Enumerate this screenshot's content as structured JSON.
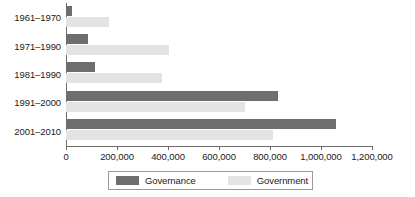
{
  "chart_data": {
    "type": "bar",
    "orientation": "horizontal",
    "title": "",
    "xlabel": "",
    "ylabel": "",
    "xlim": [
      0,
      1200000
    ],
    "grid": false,
    "legend_position": "bottom",
    "categories": [
      "1961–1970",
      "1971–1990",
      "1981–1990",
      "1991–2000",
      "2001–2010"
    ],
    "xticks": [
      0,
      200000,
      400000,
      600000,
      800000,
      1000000,
      1200000
    ],
    "xtick_labels": [
      "0",
      "200,000",
      "400,000",
      "600,000",
      "800,000",
      "1,000,000",
      "1,200,000"
    ],
    "series": [
      {
        "name": "Governance",
        "color": "#6e6e6e",
        "values": [
          25000,
          88000,
          115000,
          830000,
          1060000
        ]
      },
      {
        "name": "Government",
        "color": "#e3e3e3",
        "values": [
          170000,
          405000,
          375000,
          700000,
          810000
        ]
      }
    ]
  },
  "legend": {
    "entries": [
      {
        "label": "Governance"
      },
      {
        "label": "Government"
      }
    ]
  }
}
